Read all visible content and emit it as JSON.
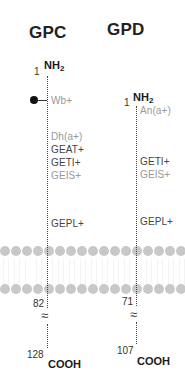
{
  "colors": {
    "strong_antigen": "#444444",
    "weak_antigen": "#999999",
    "membrane_head": "#c8c8c8",
    "chain": "#444444"
  },
  "proteins": [
    {
      "title": "GPC",
      "n_terminus": {
        "label": "NH",
        "subscript": "2",
        "residue": "1"
      },
      "antigens": [
        {
          "label": "Wb+",
          "tone": "weak",
          "glycan_marker": true
        },
        {
          "label": "Dh(a+)",
          "tone": "weak"
        },
        {
          "label": "GEAT+",
          "tone": "strong"
        },
        {
          "label": "GETI+",
          "tone": "strong"
        },
        {
          "label": "GEIS+",
          "tone": "weak"
        },
        {
          "label": "GEPL+",
          "tone": "strong"
        }
      ],
      "membrane_exit_residue": "82",
      "break_symbol": "≈",
      "c_terminus": {
        "label": "COOH",
        "residue": "128"
      }
    },
    {
      "title": "GPD",
      "n_terminus": {
        "label": "NH",
        "subscript": "2",
        "residue": "1"
      },
      "antigens": [
        {
          "label": "An(a+)",
          "tone": "weak"
        },
        {
          "label": "GETI+",
          "tone": "strong"
        },
        {
          "label": "GEIS+",
          "tone": "weak"
        },
        {
          "label": "GEPL+",
          "tone": "strong"
        }
      ],
      "membrane_exit_residue": "71",
      "break_symbol": "≈",
      "c_terminus": {
        "label": "COOH",
        "residue": "107"
      }
    }
  ],
  "membrane": {
    "heads_per_row": 17
  }
}
